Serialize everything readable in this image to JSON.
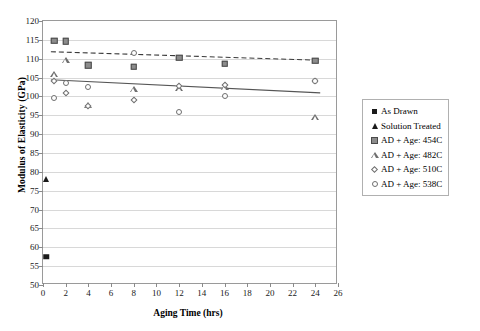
{
  "chart_data": {
    "type": "scatter",
    "title": "",
    "xlabel": "Aging Time (hrs)",
    "ylabel": "Modulus of Elasticity (GPa)",
    "xlim": [
      0,
      26
    ],
    "ylim": [
      50,
      120
    ],
    "xticks": [
      0,
      2,
      4,
      6,
      8,
      10,
      12,
      14,
      16,
      18,
      20,
      22,
      24,
      26
    ],
    "yticks": [
      50,
      55,
      60,
      65,
      70,
      75,
      80,
      85,
      90,
      95,
      100,
      105,
      110,
      115,
      120
    ],
    "grid": "horizontal",
    "legend_position": "right",
    "series": [
      {
        "name": "As Drawn",
        "marker": "square-filled",
        "color": "#1a1a1a",
        "points": [
          [
            0.3,
            57.5
          ]
        ]
      },
      {
        "name": "Solution Treated",
        "marker": "triangle-filled",
        "color": "#1a1a1a",
        "points": [
          [
            0.3,
            78.0
          ]
        ]
      },
      {
        "name": "AD + Age: 454C",
        "marker": "square-gray",
        "color": "#8c8c8c",
        "points": [
          [
            1.0,
            114.8
          ],
          [
            2.0,
            114.6
          ],
          [
            4.0,
            108.3
          ],
          [
            8.0,
            107.9
          ],
          [
            12.0,
            110.2
          ],
          [
            16.0,
            108.6
          ],
          [
            24.0,
            109.5
          ]
        ]
      },
      {
        "name": "AD + Age: 482C",
        "marker": "triangle-open",
        "color": "#6f6f6f",
        "points": [
          [
            1.0,
            106.0
          ],
          [
            2.0,
            109.6
          ],
          [
            4.0,
            97.6
          ],
          [
            8.0,
            102.1
          ],
          [
            12.0,
            102.3
          ],
          [
            16.0,
            102.6
          ],
          [
            24.0,
            94.5
          ]
        ]
      },
      {
        "name": "AD + Age: 510C",
        "marker": "diamond-open",
        "color": "#6f6f6f",
        "points": [
          [
            1.0,
            104.2
          ],
          [
            2.0,
            100.8
          ],
          [
            4.0,
            97.5
          ],
          [
            8.0,
            99.0
          ],
          [
            12.0,
            102.8
          ],
          [
            16.0,
            103.0
          ],
          [
            24.0,
            104.0
          ]
        ]
      },
      {
        "name": "AD + Age: 538C",
        "marker": "circle-open",
        "color": "#6f6f6f",
        "points": [
          [
            1.0,
            99.7
          ],
          [
            2.0,
            103.5
          ],
          [
            4.0,
            102.6
          ],
          [
            8.0,
            111.4
          ],
          [
            12.0,
            96.0
          ],
          [
            16.0,
            100.0
          ],
          [
            24.0,
            104.2
          ]
        ]
      }
    ],
    "trendlines": [
      {
        "name": "upper-dashed-trend",
        "style": "dashed",
        "color": "#3a3a3a",
        "x": [
          0.7,
          24.6
        ],
        "y": [
          111.8,
          109.5
        ]
      },
      {
        "name": "lower-solid-trend",
        "style": "solid",
        "color": "#555555",
        "x": [
          0.7,
          24.6
        ],
        "y": [
          104.3,
          100.8
        ]
      }
    ]
  },
  "legend": {
    "items": [
      {
        "label": "As Drawn",
        "marker": "square-filled"
      },
      {
        "label": "Solution Treated",
        "marker": "triangle-filled"
      },
      {
        "label": "AD + Age: 454C",
        "marker": "square-gray"
      },
      {
        "label": "AD + Age: 482C",
        "marker": "triangle-open"
      },
      {
        "label": "AD + Age: 510C",
        "marker": "diamond-open"
      },
      {
        "label": "AD + Age: 538C",
        "marker": "circle-open"
      }
    ]
  }
}
